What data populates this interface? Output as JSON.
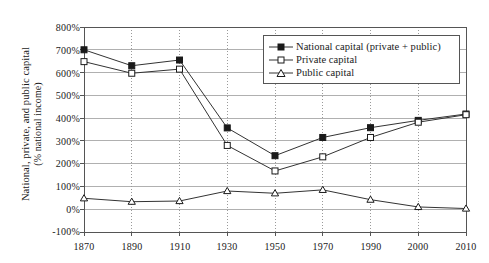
{
  "chart_data": {
    "type": "line",
    "title": "",
    "xlabel": "",
    "ylabel": "National, private, and public capital (% national income)",
    "ylabel_line1": "National, private, and public capital",
    "ylabel_line2": "(% national income)",
    "categories": [
      "1870",
      "1890",
      "1910",
      "1930",
      "1950",
      "1970",
      "1990",
      "2000",
      "2010"
    ],
    "ylim": [
      -100,
      800
    ],
    "ytick_labels": [
      "800%",
      "700%",
      "600%",
      "500%",
      "400%",
      "300%",
      "200%",
      "100%",
      "0%",
      "-100%"
    ],
    "ytick_values": [
      800,
      700,
      600,
      500,
      400,
      300,
      200,
      100,
      0,
      -100
    ],
    "grid": true,
    "grid_x": true,
    "grid_y": true,
    "legend_position": "top-right",
    "series": [
      {
        "name": "National capital (private + public)",
        "marker": "filled-square",
        "values": [
          700,
          630,
          655,
          357,
          235,
          315,
          358,
          390,
          418
        ]
      },
      {
        "name": "Private capital",
        "marker": "open-square",
        "values": [
          648,
          597,
          615,
          280,
          168,
          230,
          315,
          382,
          415
        ]
      },
      {
        "name": "Public capital",
        "marker": "open-triangle",
        "values": [
          48,
          33,
          36,
          80,
          70,
          85,
          42,
          10,
          3
        ]
      }
    ]
  },
  "legend": {
    "items": [
      {
        "label": "National capital (private + public)",
        "marker": "filled-square"
      },
      {
        "label": "Private capital",
        "marker": "open-square"
      },
      {
        "label": "Public capital",
        "marker": "open-triangle"
      }
    ]
  },
  "colors": {
    "line": "#333333",
    "grid": "#b0b0b0",
    "grid_dotted": "#9a9a9a",
    "axis": "#555555",
    "text": "#1a1a1a",
    "background": "#ffffff"
  }
}
